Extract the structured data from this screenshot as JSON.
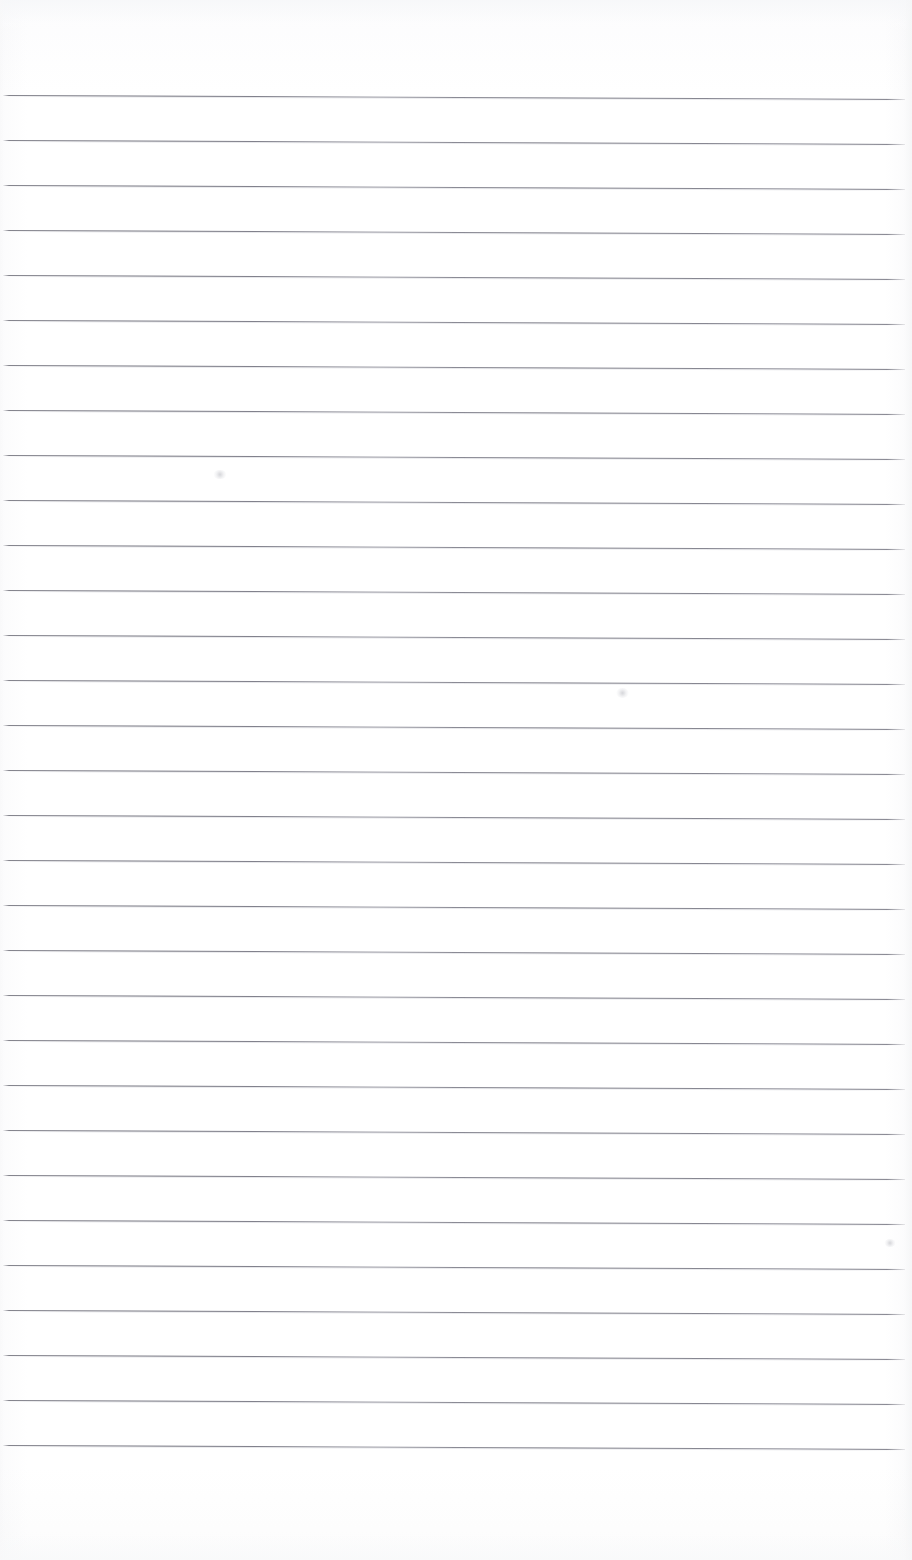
{
  "document": {
    "kind": "scanned-lined-notepad-page",
    "title": "Blank ruled notepad page",
    "content_text": "",
    "page_width": 912,
    "page_height": 1560,
    "paper_color": "#fdfdfd",
    "rule_color": "#6e6e7a",
    "is_blank": true
  },
  "ruling": {
    "line_count": 31,
    "line_spacing_px": 45,
    "first_line_y": 95,
    "last_line_y": 1455,
    "line_start_x": 3,
    "line_end_x": 905,
    "line_thickness_px": 1,
    "skew_drop_px": 4,
    "top_margin_px": 95,
    "bottom_margin_px": 105
  },
  "artifacts": [
    {
      "name": "scan-smudge-upper-left",
      "x": 213,
      "y": 470,
      "w": 14,
      "h": 9
    },
    {
      "name": "scan-smudge-center",
      "x": 616,
      "y": 688,
      "w": 13,
      "h": 10
    },
    {
      "name": "scan-smudge-right",
      "x": 884,
      "y": 1239,
      "w": 12,
      "h": 8
    }
  ]
}
